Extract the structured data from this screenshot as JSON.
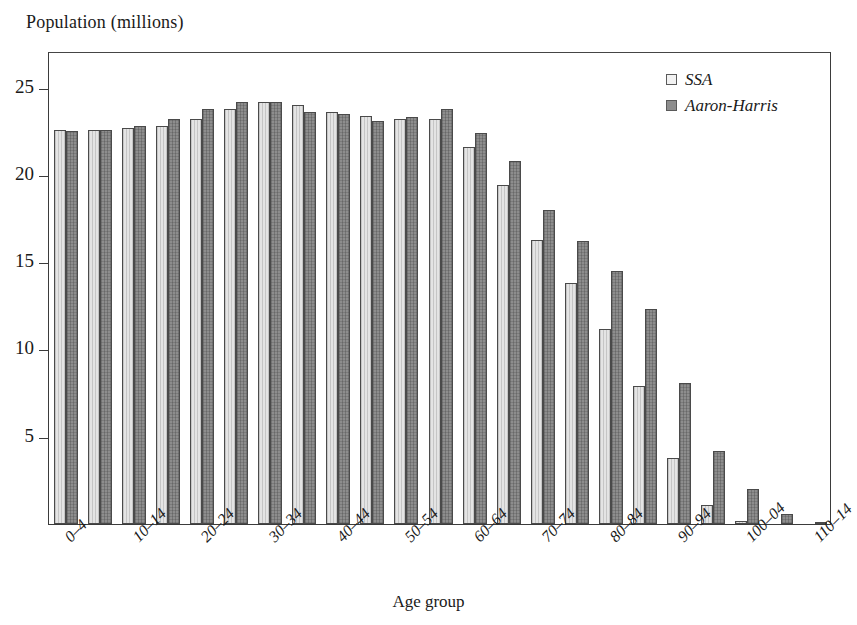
{
  "chart_data": {
    "type": "bar",
    "title": "",
    "ylabel": "Population (millions)",
    "xlabel": "Age group",
    "ylim": [
      0,
      27.1
    ],
    "yticks": [
      5,
      10,
      15,
      20,
      25
    ],
    "grid": false,
    "legend_position": "top-right",
    "categories": [
      "0–4",
      "5–9",
      "10–14",
      "15–19",
      "20–24",
      "25–29",
      "30–34",
      "35–39",
      "40–44",
      "45–49",
      "50–54",
      "55–59",
      "60–64",
      "65–69",
      "70–74",
      "75–79",
      "80–84",
      "85–89",
      "90–94",
      "95–99",
      "100–04",
      "105–09",
      "110–14"
    ],
    "visible_tick_labels": [
      "0–4",
      "10–14",
      "20–24",
      "30–34",
      "40–44",
      "50–54",
      "60–64",
      "70–74",
      "80–84",
      "90–94",
      "100–04",
      "110–14"
    ],
    "series": [
      {
        "name": "SSA",
        "color": "#e4e4e4",
        "values": [
          22.6,
          22.6,
          22.7,
          22.8,
          23.2,
          23.8,
          24.2,
          24.0,
          23.6,
          23.4,
          23.2,
          23.2,
          21.6,
          19.4,
          16.3,
          13.8,
          11.2,
          7.9,
          3.8,
          1.1,
          0.2,
          0.0,
          0.0
        ]
      },
      {
        "name": "Aaron-Harris",
        "color": "#8d8d8d",
        "values": [
          22.5,
          22.6,
          22.8,
          23.2,
          23.8,
          24.2,
          24.2,
          23.6,
          23.5,
          23.1,
          23.3,
          23.8,
          22.4,
          20.8,
          18.0,
          16.2,
          14.5,
          12.3,
          8.1,
          4.2,
          2.0,
          0.6,
          0.1
        ]
      }
    ]
  },
  "legend": {
    "items": [
      {
        "label": "SSA",
        "swatch": "light-gray-swatch"
      },
      {
        "label": "Aaron-Harris",
        "swatch": "dark-gray-swatch"
      }
    ]
  }
}
